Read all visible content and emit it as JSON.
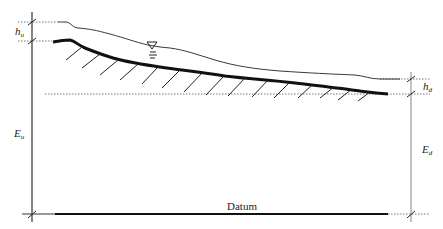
{
  "diagram": {
    "labels": {
      "h_u": "h",
      "h_u_sub": "u",
      "h_d": "h",
      "h_d_sub": "d",
      "E_u": "E",
      "E_u_sub": "u",
      "E_d": "E",
      "E_d_sub": "d",
      "datum": "Datum"
    },
    "elements": [
      "upstream-reference-line",
      "downstream-reference-line",
      "water-surface-profile",
      "channel-bed-profile",
      "water-surface-symbol",
      "bed-hatching",
      "datum-line"
    ],
    "colors": {
      "line": "#1a1a1a",
      "dashed": "#555555",
      "guide": "#9a9a9a"
    }
  }
}
